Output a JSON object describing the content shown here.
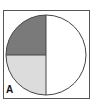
{
  "figure": {
    "label": "A",
    "colors": {
      "top_left": "#7a7a7a",
      "bottom_left": "#dcdcdc",
      "right": "#ffffff",
      "outline": "#444444"
    },
    "fractions": {
      "top_left": "1/4",
      "bottom_left": "1/4",
      "right": "1/2"
    }
  }
}
